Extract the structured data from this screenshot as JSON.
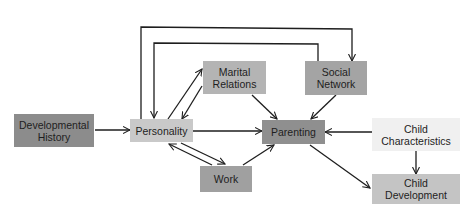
{
  "diagram": {
    "nodes": {
      "developmental_history": {
        "label": "Developmental\nHistory",
        "fill": "#8c8c8c"
      },
      "personality": {
        "label": "Personality",
        "fill": "#c9c9c9"
      },
      "marital_relations": {
        "label": "Marital\nRelations",
        "fill": "#b4b4b4"
      },
      "social_network": {
        "label": "Social\nNetwork",
        "fill": "#a4a4a4"
      },
      "work": {
        "label": "Work",
        "fill": "#a0a0a0"
      },
      "parenting": {
        "label": "Parenting",
        "fill": "#8f8f8f"
      },
      "child_characteristics": {
        "label": "Child\nCharacteristics",
        "fill": "#f0f0f0"
      },
      "child_development": {
        "label": "Child\nDevelopment",
        "fill": "#c4c4c4"
      }
    },
    "edges": [
      {
        "from": "Developmental History",
        "to": "Personality"
      },
      {
        "from": "Personality",
        "to": "Marital Relations"
      },
      {
        "from": "Marital Relations",
        "to": "Personality"
      },
      {
        "from": "Personality",
        "to": "Social Network"
      },
      {
        "from": "Social Network",
        "to": "Personality"
      },
      {
        "from": "Personality",
        "to": "Work"
      },
      {
        "from": "Work",
        "to": "Personality"
      },
      {
        "from": "Personality",
        "to": "Parenting"
      },
      {
        "from": "Marital Relations",
        "to": "Parenting"
      },
      {
        "from": "Social Network",
        "to": "Parenting"
      },
      {
        "from": "Work",
        "to": "Parenting"
      },
      {
        "from": "Child Characteristics",
        "to": "Parenting"
      },
      {
        "from": "Child Characteristics",
        "to": "Child Development"
      },
      {
        "from": "Parenting",
        "to": "Child Development"
      }
    ]
  }
}
